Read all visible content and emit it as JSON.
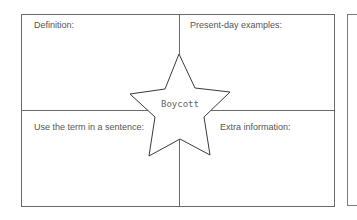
{
  "worksheet": {
    "center_term": "Boycott",
    "quadrants": {
      "top_left": {
        "label": "Definition:"
      },
      "top_right": {
        "label": "Present-day examples:"
      },
      "bottom_left": {
        "label": "Use the term in a sentence:"
      },
      "bottom_right": {
        "label": "Extra information:"
      }
    },
    "colors": {
      "line": "#555555",
      "text": "#555555",
      "background": "#ffffff"
    }
  }
}
